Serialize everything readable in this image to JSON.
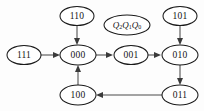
{
  "diagram": {
    "type": "state-transition-diagram",
    "title": "",
    "background_color": "#fdfdfd",
    "node_fill": "#ffffff",
    "node_stroke": "#1a1a1a",
    "edge_color": "#4a4a4a",
    "text_color": "#141414",
    "nodes": [
      {
        "id": "110",
        "label": "110",
        "cx": 77,
        "cy": 16,
        "rx": 17,
        "ry": 9.5,
        "kind": "state"
      },
      {
        "id": "qlabel",
        "label": "Q2Q1Q0",
        "cx": 127,
        "cy": 25,
        "rx": 23,
        "ry": 10,
        "kind": "legend"
      },
      {
        "id": "101",
        "label": "101",
        "cx": 180,
        "cy": 16,
        "rx": 17,
        "ry": 9.5,
        "kind": "state"
      },
      {
        "id": "111",
        "label": "111",
        "cx": 24,
        "cy": 55,
        "rx": 17,
        "ry": 9.5,
        "kind": "state"
      },
      {
        "id": "000",
        "label": "000",
        "cx": 78,
        "cy": 55,
        "rx": 18,
        "ry": 10,
        "kind": "state"
      },
      {
        "id": "001",
        "label": "001",
        "cx": 131,
        "cy": 55,
        "rx": 17,
        "ry": 9.5,
        "kind": "state"
      },
      {
        "id": "010",
        "label": "010",
        "cx": 180,
        "cy": 55,
        "rx": 18,
        "ry": 10,
        "kind": "state"
      },
      {
        "id": "100",
        "label": "100",
        "cx": 78,
        "cy": 95,
        "rx": 18,
        "ry": 10,
        "kind": "state"
      },
      {
        "id": "011",
        "label": "011",
        "cx": 180,
        "cy": 95,
        "rx": 18,
        "ry": 10,
        "kind": "state"
      }
    ],
    "edges": [
      {
        "from": "111",
        "to": "000",
        "label": "",
        "direction": "right"
      },
      {
        "from": "110",
        "to": "000",
        "label": "",
        "direction": "down"
      },
      {
        "from": "000",
        "to": "001",
        "label": "",
        "direction": "right"
      },
      {
        "from": "001",
        "to": "010",
        "label": "",
        "direction": "right"
      },
      {
        "from": "101",
        "to": "010",
        "label": "",
        "direction": "down"
      },
      {
        "from": "010",
        "to": "011",
        "label": "",
        "direction": "down"
      },
      {
        "from": "011",
        "to": "100",
        "label": "",
        "direction": "left"
      },
      {
        "from": "100",
        "to": "000",
        "label": "",
        "direction": "up"
      }
    ],
    "legend_label": {
      "base": "Q",
      "subscripts": [
        "2",
        "1",
        "0"
      ]
    }
  }
}
